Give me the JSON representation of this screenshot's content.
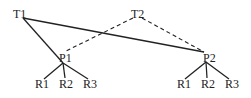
{
  "diagram": {
    "nodes": {
      "T1": {
        "label": "T1"
      },
      "T2": {
        "label": "T2"
      },
      "P1": {
        "label": "P1"
      },
      "P2": {
        "label": "P2"
      },
      "P1_R1": {
        "label": "R1"
      },
      "P1_R2": {
        "label": "R2"
      },
      "P1_R3": {
        "label": "R3"
      },
      "P2_R1": {
        "label": "R1"
      },
      "P2_R2": {
        "label": "R2"
      },
      "P2_R3": {
        "label": "R3"
      }
    },
    "edges": [
      {
        "from": "T1",
        "to": "P1",
        "style": "solid"
      },
      {
        "from": "T1",
        "to": "P2",
        "style": "solid"
      },
      {
        "from": "T2",
        "to": "P1",
        "style": "dashed"
      },
      {
        "from": "T2",
        "to": "P2",
        "style": "dashed"
      },
      {
        "from": "P1",
        "to": "P1_R1",
        "style": "solid"
      },
      {
        "from": "P1",
        "to": "P1_R2",
        "style": "solid"
      },
      {
        "from": "P1",
        "to": "P1_R3",
        "style": "solid"
      },
      {
        "from": "P2",
        "to": "P2_R1",
        "style": "solid"
      },
      {
        "from": "P2",
        "to": "P2_R2",
        "style": "solid"
      },
      {
        "from": "P2",
        "to": "P2_R3",
        "style": "solid"
      }
    ]
  }
}
